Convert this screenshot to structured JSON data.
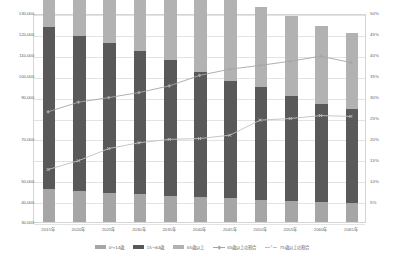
{
  "chart_data": {
    "type": "bar",
    "subtype": "stacked-bar-with-lines",
    "title": "",
    "xlabel": "",
    "ylabel": "",
    "grid": true,
    "legend_position": "bottom",
    "categories": [
      "2015年",
      "2020年",
      "2025年",
      "2030年",
      "2035年",
      "2040年",
      "2045年",
      "2050年",
      "2055年",
      "2060年",
      "2065年"
    ],
    "left_axis": {
      "ylabel": "",
      "ylim": [
        30000,
        130000
      ],
      "ticks": [
        130000,
        120000,
        110000,
        100000,
        90000,
        70000,
        50000,
        40000,
        30000
      ],
      "tick_labels": [
        "130,000",
        "120,000",
        "110,000",
        "100,000",
        "90,000",
        "70,000",
        "50,000",
        "40,000",
        "30,000"
      ],
      "full_ticks": [
        130000,
        120000,
        110000,
        100000,
        90000,
        80000,
        70000,
        60000,
        50000,
        40000,
        30000
      ],
      "full_tick_labels": [
        "130,000",
        "120,000",
        "110,000",
        "100,000",
        "90,000",
        "80,000",
        "70,000",
        "60,000",
        "50,000",
        "40,000",
        "30,000"
      ]
    },
    "right_axis": {
      "ylabel": "",
      "ylim": [
        0,
        50
      ],
      "ticks": [
        50,
        45,
        40,
        35,
        30,
        25,
        20,
        15,
        10,
        5
      ],
      "tick_labels": [
        "50%",
        "45%",
        "40%",
        "35%",
        "30%",
        "25%",
        "20%",
        "15%",
        "10%",
        "5%"
      ]
    },
    "series": [
      {
        "name": "0～14歳",
        "type": "bar",
        "axis": "left",
        "color": "#a6a6a6",
        "values": [
          15945,
          15075,
          14073,
          13212,
          12457,
          11936,
          11384,
          10767,
          10123,
          9508,
          8975
        ]
      },
      {
        "name": "15～64歳",
        "type": "bar",
        "axis": "left",
        "color": "#595959",
        "values": [
          77282,
          74058,
          71701,
          68754,
          64942,
          59777,
          56276,
          53687,
          50276,
          47063,
          45291
        ]
      },
      {
        "name": "65歳以上",
        "type": "bar",
        "axis": "left",
        "color": "#b2b2b2",
        "values": [
          33868,
          36192,
          36771,
          37160,
          37817,
          38678,
          39192,
          38406,
          38068,
          37335,
          36146
        ]
      },
      {
        "name": "65歳以上の割合",
        "type": "line",
        "axis": "right",
        "color": "#a6a6a6",
        "marker": "diamond",
        "values": [
          26.6,
          28.9,
          30.0,
          31.2,
          32.8,
          35.3,
          36.8,
          37.7,
          38.7,
          39.9,
          38.4
        ]
      },
      {
        "name": "75歳以上の割合",
        "type": "line",
        "axis": "right",
        "color": "#bfbfbf",
        "marker": "x",
        "values": [
          12.8,
          14.9,
          17.8,
          19.2,
          20.0,
          20.2,
          21.0,
          24.6,
          25.0,
          25.7,
          25.5
        ]
      }
    ]
  },
  "legend": {
    "items": [
      {
        "label": "0～14歳",
        "kind": "bar",
        "color": "#a6a6a6"
      },
      {
        "label": "15～64歳",
        "kind": "bar",
        "color": "#595959"
      },
      {
        "label": "65歳以上",
        "kind": "bar",
        "color": "#b2b2b2"
      },
      {
        "label": "65歳以上の割合",
        "kind": "line",
        "color": "#a6a6a6",
        "marker": "diamond"
      },
      {
        "label": "75歳以上の割合",
        "kind": "line",
        "color": "#bfbfbf",
        "marker": "x"
      }
    ]
  },
  "colors": {
    "age_0_14": "#a6a6a6",
    "age_15_64": "#595959",
    "age_65_plus": "#b2b2b2",
    "line_65_ratio": "#a6a6a6",
    "line_75_ratio": "#bfbfbf",
    "gridline": "#e3e3e3",
    "axis_text": "#5f5f5f",
    "plot_border": "#d4d4d4",
    "background": "#ffffff"
  }
}
